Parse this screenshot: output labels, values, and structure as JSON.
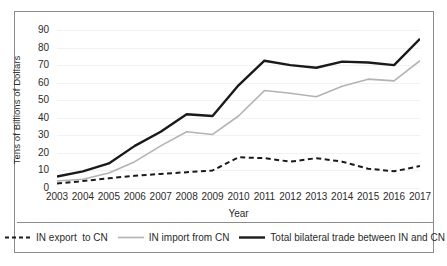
{
  "chart_data": {
    "type": "line",
    "title": "",
    "xlabel": "Year",
    "ylabel": "Tens of Billions of Dollars",
    "categories": [
      "2003",
      "2004",
      "2005",
      "2006",
      "2007",
      "2008",
      "2009",
      "2010",
      "2011",
      "2012",
      "2013",
      "2014",
      "2015",
      "2016",
      "2017"
    ],
    "x": [
      2003,
      2004,
      2005,
      2006,
      2007,
      2008,
      2009,
      2010,
      2011,
      2012,
      2013,
      2014,
      2015,
      2016,
      2017
    ],
    "xlim": [
      2003,
      2017
    ],
    "ylim": [
      0,
      90
    ],
    "yticks": [
      0,
      10,
      20,
      30,
      40,
      50,
      60,
      70,
      80,
      90
    ],
    "xticks": [
      "2003",
      "2004",
      "2005",
      "2006",
      "2007",
      "2008",
      "2009",
      "2010",
      "2011",
      "2012",
      "2013",
      "2014",
      "2015",
      "2016",
      "2017"
    ],
    "grid": true,
    "legend_position": "bottom",
    "series": [
      {
        "name": "IN export  to CN",
        "style": "dashed",
        "color": "#1a1a1a",
        "width": 2.0,
        "values": [
          2.5,
          4.0,
          5.5,
          7.0,
          8.0,
          9.0,
          10.0,
          17.5,
          17.0,
          15.0,
          17.0,
          15.0,
          11.0,
          9.5,
          12.5
        ]
      },
      {
        "name": "IN import from CN",
        "style": "solid",
        "color": "#b3b3b3",
        "width": 1.6,
        "values": [
          4.0,
          5.0,
          8.5,
          15.0,
          24.0,
          32.0,
          30.5,
          41.0,
          55.5,
          54.0,
          52.0,
          58.0,
          62.0,
          61.0,
          72.5
        ]
      },
      {
        "name": "Total bilateral trade between IN and CN",
        "style": "solid",
        "color": "#1a1a1a",
        "width": 2.4,
        "values": [
          6.5,
          9.5,
          14.0,
          24.0,
          32.0,
          42.0,
          41.0,
          58.5,
          72.5,
          70.0,
          68.5,
          72.0,
          71.5,
          70.0,
          85.0
        ]
      }
    ],
    "legend": [
      {
        "label": "IN export  to CN",
        "style": "dashed",
        "color": "#1a1a1a"
      },
      {
        "label": "IN import from CN",
        "style": "solid",
        "color": "#b3b3b3"
      },
      {
        "label": "Total bilateral trade between IN and CN",
        "style": "solid",
        "color": "#1a1a1a"
      }
    ]
  }
}
